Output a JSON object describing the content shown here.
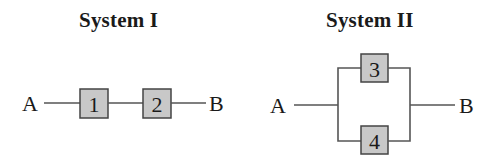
{
  "systems": [
    {
      "title": "System I",
      "configuration": "series",
      "input": "A",
      "output": "B",
      "components": [
        "1",
        "2"
      ]
    },
    {
      "title": "System II",
      "configuration": "parallel",
      "input": "A",
      "output": "B",
      "components": [
        "3",
        "4"
      ]
    }
  ],
  "colors": {
    "component_fill": "#c8c8c8",
    "component_stroke": "#444444",
    "wire": "#555555",
    "text": "#1a1a1a"
  }
}
